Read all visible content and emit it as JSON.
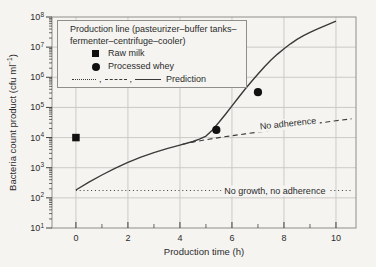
{
  "page": {
    "bg": "#f5f4f1"
  },
  "chart_data": {
    "type": "line",
    "xlabel": "Production time (h)",
    "ylabel": {
      "pre": "Bacteria count product (cfu ml",
      "sup": "−1",
      "post": ")"
    },
    "x_ticks": [
      0,
      2,
      4,
      6,
      8,
      10
    ],
    "x_minor_ticks": [
      1,
      3,
      5,
      7,
      9
    ],
    "y_tick_exponents": [
      1,
      2,
      3,
      4,
      5,
      6,
      7,
      8
    ],
    "xlim": [
      -0.92,
      10.77
    ],
    "ylim_exp": [
      1,
      8
    ],
    "grid": true,
    "legend_position": "upper left",
    "colors": {
      "line": "#3a3a3a",
      "grid": "#c7c6c3",
      "border": "#8f8e8b",
      "text": "#2b2b2b",
      "marker": "#111111"
    },
    "series": [
      {
        "name": "prediction-growth-and-adherence",
        "style": "solid",
        "x": [
          0,
          0.5,
          1,
          1.5,
          2,
          2.5,
          3,
          3.5,
          4,
          4.5,
          4.75,
          5,
          5.25,
          5.5,
          5.75,
          6,
          6.25,
          6.5,
          6.75,
          7,
          7.25,
          7.5,
          7.75,
          8,
          8.25,
          8.5,
          8.75,
          9,
          9.25,
          9.5,
          9.75,
          10
        ],
        "y": [
          182,
          331,
          575,
          955,
          1510,
          2240,
          3160,
          4270,
          5620,
          7410,
          8910,
          11200,
          18000,
          32000,
          59000,
          112000,
          214000,
          400000,
          724000,
          1290000,
          2240000,
          3720000,
          5890000,
          8910000,
          12900000,
          18200000,
          24000000,
          30900000,
          38900000,
          47900000,
          58900000,
          72400000
        ]
      },
      {
        "name": "prediction-no-adherence",
        "style": "dashed",
        "x": [
          4.1,
          4.5,
          5,
          5.5,
          6,
          6.5,
          7,
          7.5,
          8,
          8.5,
          9,
          9.5,
          10,
          10.6
        ],
        "y": [
          6000,
          7080,
          8510,
          10000,
          11500,
          13200,
          15100,
          17400,
          20000,
          23400,
          27500,
          31600,
          36300,
          42000
        ]
      },
      {
        "name": "prediction-no-growth-no-adherence",
        "style": "dotted",
        "x": [
          0,
          10.6
        ],
        "y": [
          175,
          175
        ]
      }
    ],
    "scatter": [
      {
        "name": "raw-milk",
        "marker": "square",
        "points": [
          [
            0,
            10000
          ]
        ]
      },
      {
        "name": "processed-whey",
        "marker": "circle",
        "points": [
          [
            5.4,
            18000
          ],
          [
            7.0,
            320000
          ]
        ]
      }
    ],
    "annotations": [
      {
        "text": "No adherence",
        "x": 8.15,
        "y": 29000,
        "angle": -6
      },
      {
        "text": "No growth, no adherence",
        "x": 7.65,
        "y": 175,
        "angle": 0
      }
    ]
  },
  "legend": {
    "title_line1": "Production line (pasteurizer–buffer tanks–",
    "title_line2": "fermenter–centrifuge–cooler)",
    "items": [
      {
        "marker": "square",
        "label": "Raw milk"
      },
      {
        "marker": "circle",
        "label": "Processed whey"
      }
    ],
    "prediction_row": {
      "separator": ",",
      "label": "Prediction"
    }
  }
}
